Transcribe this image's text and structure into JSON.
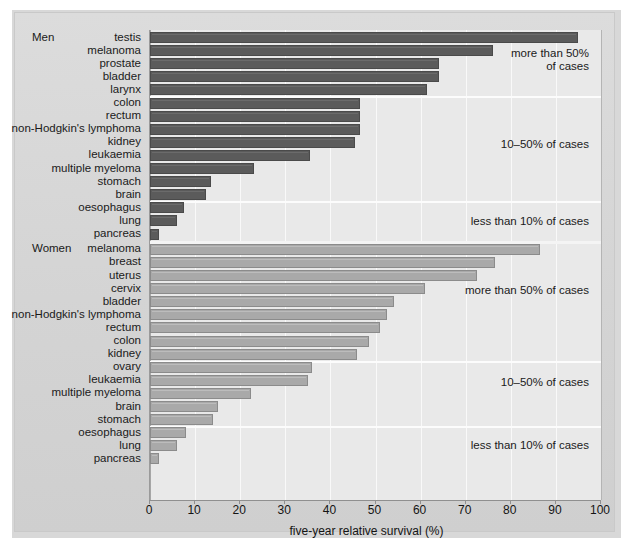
{
  "figure": {
    "background_color": "#d6d6d6",
    "plot_background_color": "#e9e9e9",
    "men_bar_color": "#5b5b5b",
    "women_bar_color": "#a9a9a9"
  },
  "groups": {
    "men_label": "Men",
    "women_label": "Women"
  },
  "annotations": {
    "men_more_than_50_line1": "more than 50%",
    "men_more_than_50_line2": "of cases",
    "men_10_50": "10–50% of cases",
    "men_less_than_10": "less than 10% of cases",
    "women_more_than_50": "more than 50% of cases",
    "women_10_50": "10–50% of cases",
    "women_less_than_10": "less than 10% of cases"
  },
  "chart_data": {
    "type": "bar",
    "orientation": "horizontal",
    "title": "",
    "xlabel": "five-year relative survival (%)",
    "ylabel": "",
    "xlim": [
      0,
      100
    ],
    "xticks": [
      0,
      10,
      20,
      30,
      40,
      50,
      60,
      70,
      80,
      90,
      100
    ],
    "xtick_labels": [
      "0",
      "10",
      "20",
      "30",
      "40",
      "50",
      "60",
      "70",
      "80",
      "90",
      "100"
    ],
    "grid": "vertical",
    "legend": "none",
    "series": [
      {
        "name": "Men",
        "color": "#5b5b5b",
        "categories": [
          "testis",
          "melanoma",
          "prostate",
          "bladder",
          "larynx",
          "colon",
          "rectum",
          "non-Hodgkin's lymphoma",
          "kidney",
          "leukaemia",
          "multiple myeloma",
          "stomach",
          "brain",
          "oesophagus",
          "lung",
          "pancreas"
        ],
        "values": [
          95,
          76,
          64,
          64,
          61.5,
          46.5,
          46.5,
          46.5,
          45.5,
          35.5,
          23,
          13.5,
          12.5,
          7.5,
          6,
          2
        ]
      },
      {
        "name": "Women",
        "color": "#a9a9a9",
        "categories": [
          "melanoma",
          "breast",
          "uterus",
          "cervix",
          "bladder",
          "non-Hodgkin's lymphoma",
          "rectum",
          "colon",
          "kidney",
          "ovary",
          "leukaemia",
          "multiple myeloma",
          "brain",
          "stomach",
          "oesophagus",
          "lung",
          "pancreas"
        ],
        "values": [
          86.5,
          76.5,
          72.5,
          61,
          54,
          52.5,
          51,
          48.5,
          46,
          36,
          35,
          22.5,
          15,
          14,
          8,
          6,
          2
        ]
      }
    ],
    "bands": [
      {
        "label": "more than 50% of cases",
        "range": [
          50,
          100
        ]
      },
      {
        "label": "10–50% of cases",
        "range": [
          10,
          50
        ]
      },
      {
        "label": "less than 10% of cases",
        "range": [
          0,
          10
        ]
      }
    ]
  }
}
